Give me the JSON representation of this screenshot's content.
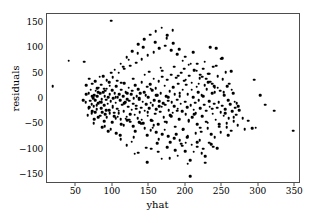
{
  "chart_data": {
    "type": "scatter",
    "title": "",
    "xlabel": "yhat",
    "ylabel": "residuals",
    "xlim": [
      10,
      358
    ],
    "ylim": [
      -168,
      168
    ],
    "xticks": [
      50,
      100,
      150,
      200,
      250,
      300,
      350
    ],
    "xtick_labels": [
      "50",
      "100",
      "150",
      "200",
      "250",
      "300",
      "350"
    ],
    "yticks": [
      150,
      100,
      50,
      0,
      -50,
      -100,
      -150
    ],
    "ytick_labels": [
      "150",
      "100",
      "50",
      "0",
      "-50",
      "-100",
      "-150"
    ],
    "grid": false,
    "legend": null,
    "marker": "circle",
    "marker_color": "#000000",
    "marker_size": 2.6,
    "n_points": 432,
    "points": [
      [
        18,
        25
      ],
      [
        40,
        76
      ],
      [
        61,
        74
      ],
      [
        64,
        27
      ],
      [
        67,
        12
      ],
      [
        69,
        -3
      ],
      [
        70,
        18
      ],
      [
        71,
        -10
      ],
      [
        72,
        30
      ],
      [
        73,
        2
      ],
      [
        74,
        -14
      ],
      [
        75,
        8
      ],
      [
        76,
        -2
      ],
      [
        77,
        16
      ],
      [
        78,
        -20
      ],
      [
        79,
        5
      ],
      [
        80,
        -8
      ],
      [
        81,
        22
      ],
      [
        82,
        -5
      ],
      [
        83,
        11
      ],
      [
        84,
        -18
      ],
      [
        85,
        0
      ],
      [
        86,
        -26
      ],
      [
        87,
        14
      ],
      [
        88,
        -12
      ],
      [
        89,
        6
      ],
      [
        90,
        -30
      ],
      [
        91,
        -1
      ],
      [
        92,
        20
      ],
      [
        93,
        -9
      ],
      [
        94,
        3
      ],
      [
        95,
        -22
      ],
      [
        96,
        9
      ],
      [
        97,
        -4
      ],
      [
        98,
        155
      ],
      [
        99,
        17
      ],
      [
        100,
        -16
      ],
      [
        101,
        1
      ],
      [
        102,
        -34
      ],
      [
        103,
        12
      ],
      [
        104,
        -7
      ],
      [
        105,
        25
      ],
      [
        106,
        -19
      ],
      [
        107,
        4
      ],
      [
        108,
        -28
      ],
      [
        109,
        10
      ],
      [
        110,
        -2
      ],
      [
        111,
        -40
      ],
      [
        112,
        18
      ],
      [
        113,
        -11
      ],
      [
        114,
        6
      ],
      [
        115,
        -24
      ],
      [
        116,
        31
      ],
      [
        117,
        -6
      ],
      [
        118,
        13
      ],
      [
        119,
        -35
      ],
      [
        120,
        0
      ],
      [
        121,
        -15
      ],
      [
        122,
        22
      ],
      [
        123,
        -3
      ],
      [
        124,
        -45
      ],
      [
        125,
        9
      ],
      [
        126,
        -21
      ],
      [
        127,
        16
      ],
      [
        128,
        -9
      ],
      [
        129,
        2
      ],
      [
        130,
        -31
      ],
      [
        131,
        27
      ],
      [
        132,
        -13
      ],
      [
        133,
        5
      ],
      [
        134,
        -38
      ],
      [
        135,
        19
      ],
      [
        136,
        -1
      ],
      [
        137,
        -26
      ],
      [
        138,
        11
      ],
      [
        139,
        -17
      ],
      [
        140,
        33
      ],
      [
        141,
        -5
      ],
      [
        142,
        -48
      ],
      [
        143,
        14
      ],
      [
        144,
        -23
      ],
      [
        145,
        7
      ],
      [
        146,
        -10
      ],
      [
        147,
        24
      ],
      [
        148,
        -33
      ],
      [
        149,
        3
      ],
      [
        150,
        -18
      ],
      [
        151,
        29
      ],
      [
        152,
        -7
      ],
      [
        153,
        -42
      ],
      [
        154,
        17
      ],
      [
        155,
        -12
      ],
      [
        156,
        40
      ],
      [
        157,
        -2
      ],
      [
        158,
        -29
      ],
      [
        159,
        21
      ],
      [
        160,
        -20
      ],
      [
        161,
        8
      ],
      [
        162,
        -50
      ],
      [
        163,
        35
      ],
      [
        164,
        -4
      ],
      [
        165,
        -25
      ],
      [
        166,
        12
      ],
      [
        167,
        -15
      ],
      [
        168,
        44
      ],
      [
        169,
        -8
      ],
      [
        170,
        -37
      ],
      [
        171,
        26
      ],
      [
        172,
        -11
      ],
      [
        173,
        6
      ],
      [
        174,
        -46
      ],
      [
        175,
        38
      ],
      [
        176,
        -3
      ],
      [
        177,
        -22
      ],
      [
        178,
        15
      ],
      [
        179,
        -32
      ],
      [
        180,
        48
      ],
      [
        181,
        -6
      ],
      [
        182,
        -27
      ],
      [
        183,
        23
      ],
      [
        184,
        -14
      ],
      [
        185,
        10
      ],
      [
        186,
        -55
      ],
      [
        187,
        42
      ],
      [
        188,
        -1
      ],
      [
        189,
        -19
      ],
      [
        190,
        30
      ],
      [
        191,
        -40
      ],
      [
        192,
        5
      ],
      [
        193,
        -9
      ],
      [
        194,
        52
      ],
      [
        195,
        -24
      ],
      [
        196,
        18
      ],
      [
        197,
        -60
      ],
      [
        198,
        36
      ],
      [
        199,
        -5
      ],
      [
        200,
        -30
      ],
      [
        201,
        28
      ],
      [
        202,
        -16
      ],
      [
        203,
        9
      ],
      [
        204,
        -44
      ],
      [
        205,
        46
      ],
      [
        206,
        -153
      ],
      [
        207,
        -12
      ],
      [
        208,
        32
      ],
      [
        209,
        -36
      ],
      [
        210,
        3
      ],
      [
        211,
        -21
      ],
      [
        212,
        56
      ],
      [
        213,
        -7
      ],
      [
        214,
        -28
      ],
      [
        215,
        24
      ],
      [
        216,
        -50
      ],
      [
        217,
        14
      ],
      [
        218,
        -2
      ],
      [
        219,
        41
      ],
      [
        220,
        -18
      ],
      [
        221,
        -65
      ],
      [
        222,
        8
      ],
      [
        223,
        -34
      ],
      [
        224,
        60
      ],
      [
        225,
        -11
      ],
      [
        226,
        27
      ],
      [
        227,
        -126
      ],
      [
        228,
        -23
      ],
      [
        229,
        19
      ],
      [
        230,
        -47
      ],
      [
        231,
        50
      ],
      [
        232,
        -4
      ],
      [
        233,
        -15
      ],
      [
        234,
        34
      ],
      [
        235,
        -70
      ],
      [
        236,
        11
      ],
      [
        237,
        -29
      ],
      [
        238,
        64
      ],
      [
        239,
        -9
      ],
      [
        240,
        22
      ],
      [
        241,
        -41
      ],
      [
        242,
        100
      ],
      [
        243,
        -17
      ],
      [
        244,
        45
      ],
      [
        245,
        -6
      ],
      [
        246,
        -55
      ],
      [
        247,
        16
      ],
      [
        248,
        -26
      ],
      [
        249,
        80
      ],
      [
        250,
        -13
      ],
      [
        251,
        39
      ],
      [
        252,
        -33
      ],
      [
        253,
        7
      ],
      [
        254,
        -20
      ],
      [
        255,
        53
      ],
      [
        256,
        -48
      ],
      [
        257,
        25
      ],
      [
        258,
        -2
      ],
      [
        259,
        -38
      ],
      [
        260,
        30
      ],
      [
        261,
        -10
      ],
      [
        262,
        -63
      ],
      [
        263,
        18
      ],
      [
        264,
        -24
      ],
      [
        265,
        12
      ],
      [
        266,
        -44
      ],
      [
        267,
        -5
      ],
      [
        268,
        -17
      ],
      [
        269,
        -31
      ],
      [
        270,
        -8
      ],
      [
        271,
        -52
      ],
      [
        272,
        -14
      ],
      [
        273,
        -22
      ],
      [
        278,
        -38
      ],
      [
        281,
        -60
      ],
      [
        286,
        -43
      ],
      [
        291,
        -58
      ],
      [
        294,
        38
      ],
      [
        296,
        -57
      ],
      [
        302,
        8
      ],
      [
        309,
        -11
      ],
      [
        321,
        -23
      ],
      [
        347,
        -63
      ],
      [
        66,
        -32
      ],
      [
        68,
        40
      ],
      [
        72,
        -24
      ],
      [
        76,
        35
      ],
      [
        80,
        -36
      ],
      [
        84,
        28
      ],
      [
        88,
        -44
      ],
      [
        92,
        37
      ],
      [
        96,
        -28
      ],
      [
        100,
        43
      ],
      [
        104,
        -38
      ],
      [
        108,
        52
      ],
      [
        112,
        -50
      ],
      [
        116,
        60
      ],
      [
        120,
        -42
      ],
      [
        124,
        66
      ],
      [
        128,
        -54
      ],
      [
        132,
        72
      ],
      [
        136,
        -46
      ],
      [
        140,
        79
      ],
      [
        144,
        -58
      ],
      [
        148,
        86
      ],
      [
        152,
        -62
      ],
      [
        156,
        93
      ],
      [
        160,
        -66
      ],
      [
        164,
        100
      ],
      [
        168,
        -70
      ],
      [
        172,
        105
      ],
      [
        176,
        -74
      ],
      [
        180,
        96
      ],
      [
        184,
        -78
      ],
      [
        188,
        88
      ],
      [
        192,
        -82
      ],
      [
        196,
        76
      ],
      [
        200,
        -86
      ],
      [
        204,
        68
      ],
      [
        208,
        -90
      ],
      [
        212,
        58
      ],
      [
        216,
        -94
      ],
      [
        220,
        48
      ],
      [
        224,
        -98
      ],
      [
        228,
        40
      ],
      [
        232,
        -86
      ],
      [
        236,
        30
      ],
      [
        240,
        -76
      ],
      [
        244,
        22
      ],
      [
        248,
        -66
      ],
      [
        252,
        14
      ],
      [
        256,
        -56
      ],
      [
        63,
        -6
      ],
      [
        67,
        -18
      ],
      [
        71,
        -28
      ],
      [
        75,
        -40
      ],
      [
        79,
        21
      ],
      [
        83,
        -33
      ],
      [
        87,
        45
      ],
      [
        91,
        -22
      ],
      [
        95,
        33
      ],
      [
        99,
        -46
      ],
      [
        103,
        58
      ],
      [
        107,
        -35
      ],
      [
        111,
        70
      ],
      [
        115,
        -52
      ],
      [
        119,
        83
      ],
      [
        123,
        -41
      ],
      [
        127,
        94
      ],
      [
        131,
        -64
      ],
      [
        135,
        108
      ],
      [
        139,
        -49
      ],
      [
        143,
        118
      ],
      [
        147,
        -72
      ],
      [
        151,
        127
      ],
      [
        155,
        -57
      ],
      [
        159,
        134
      ],
      [
        163,
        -80
      ],
      [
        167,
        141
      ],
      [
        171,
        -61
      ],
      [
        175,
        126
      ],
      [
        179,
        -85
      ],
      [
        183,
        110
      ],
      [
        187,
        -69
      ],
      [
        191,
        98
      ],
      [
        195,
        -92
      ],
      [
        199,
        84
      ],
      [
        203,
        -73
      ],
      [
        207,
        70
      ],
      [
        211,
        -104
      ],
      [
        215,
        56
      ],
      [
        219,
        -81
      ],
      [
        223,
        44
      ],
      [
        227,
        -113
      ],
      [
        231,
        33
      ],
      [
        235,
        -89
      ],
      [
        239,
        25
      ],
      [
        243,
        -97
      ],
      [
        74,
        -48
      ],
      [
        78,
        -12
      ],
      [
        82,
        44
      ],
      [
        86,
        -56
      ],
      [
        90,
        16
      ],
      [
        94,
        -64
      ],
      [
        98,
        52
      ],
      [
        102,
        -27
      ],
      [
        106,
        36
      ],
      [
        110,
        -72
      ],
      [
        114,
        64
      ],
      [
        118,
        -39
      ],
      [
        122,
        78
      ],
      [
        126,
        -84
      ],
      [
        130,
        -108
      ],
      [
        134,
        90
      ],
      [
        138,
        -47
      ],
      [
        142,
        102
      ],
      [
        146,
        -96
      ],
      [
        150,
        54
      ],
      [
        154,
        -43
      ],
      [
        158,
        112
      ],
      [
        162,
        -104
      ],
      [
        166,
        62
      ],
      [
        170,
        -35
      ],
      [
        174,
        120
      ],
      [
        178,
        -117
      ],
      [
        182,
        136
      ],
      [
        186,
        -101
      ],
      [
        190,
        46
      ],
      [
        194,
        -88
      ],
      [
        198,
        60
      ],
      [
        202,
        -76
      ],
      [
        206,
        -121
      ],
      [
        210,
        92
      ],
      [
        214,
        -68
      ],
      [
        218,
        30
      ],
      [
        222,
        -107
      ],
      [
        226,
        74
      ],
      [
        230,
        -58
      ],
      [
        234,
        102
      ],
      [
        238,
        -94
      ],
      [
        242,
        66
      ],
      [
        246,
        -50
      ],
      [
        250,
        81
      ],
      [
        254,
        -28
      ],
      [
        258,
        -71
      ],
      [
        262,
        55
      ],
      [
        266,
        -36
      ],
      [
        60,
        -2
      ],
      [
        64,
        10
      ],
      [
        68,
        -16
      ],
      [
        72,
        6
      ],
      [
        76,
        -26
      ],
      [
        80,
        14
      ],
      [
        84,
        -6
      ],
      [
        88,
        20
      ],
      [
        92,
        -36
      ],
      [
        96,
        26
      ],
      [
        100,
        -13
      ],
      [
        104,
        4
      ],
      [
        108,
        -23
      ],
      [
        112,
        32
      ],
      [
        116,
        -8
      ],
      [
        120,
        12
      ],
      [
        124,
        -30
      ],
      [
        128,
        40
      ],
      [
        132,
        -19
      ],
      [
        136,
        2
      ],
      [
        140,
        -41
      ],
      [
        144,
        48
      ],
      [
        148,
        -26
      ],
      [
        152,
        20
      ],
      [
        156,
        -52
      ],
      [
        160,
        8
      ],
      [
        164,
        -14
      ],
      [
        168,
        56
      ],
      [
        172,
        -45
      ],
      [
        176,
        4
      ],
      [
        180,
        -34
      ],
      [
        184,
        64
      ],
      [
        188,
        -23
      ],
      [
        192,
        12
      ],
      [
        196,
        -61
      ],
      [
        200,
        38
      ],
      [
        204,
        -42
      ],
      [
        208,
        18
      ],
      [
        212,
        -30
      ],
      [
        216,
        70
      ],
      [
        220,
        -57
      ],
      [
        224,
        6
      ],
      [
        228,
        -45
      ],
      [
        232,
        50
      ],
      [
        236,
        -19
      ],
      [
        240,
        14
      ],
      [
        147,
        -125
      ],
      [
        167,
        -118
      ],
      [
        199,
        -103
      ],
      [
        216,
        -85
      ],
      [
        153,
        -98
      ],
      [
        119,
        -91
      ],
      [
        135,
        -106
      ],
      [
        111,
        -80
      ],
      [
        203,
        -128
      ],
      [
        189,
        -112
      ],
      [
        175,
        -95
      ],
      [
        161,
        -87
      ],
      [
        129,
        -76
      ],
      [
        105,
        -68
      ],
      [
        97,
        -60
      ],
      [
        89,
        -54
      ]
    ]
  },
  "figure": {
    "background_color": "#ffffff",
    "axis_color": "#4d4d4d",
    "point_color": "#000000"
  }
}
